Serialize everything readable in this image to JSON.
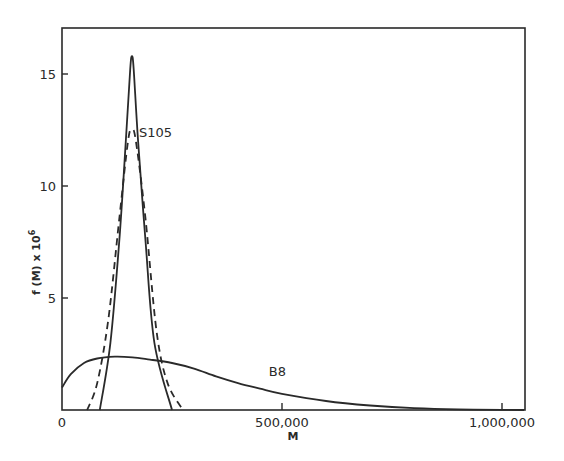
{
  "chart_data": {
    "type": "line",
    "title": "",
    "xlabel": "M",
    "ylabel": "f (M) x 10^6",
    "ylabel_display": "f (M) x 10",
    "ylabel_sup": "6",
    "xlim": [
      0,
      1050000
    ],
    "ylim": [
      0,
      17
    ],
    "grid": false,
    "legend": "none (inline labels)",
    "x_ticks": [
      {
        "value": 0,
        "label": "0"
      },
      {
        "value": 500000,
        "label": "500,000"
      },
      {
        "value": 1000000,
        "label": "1,000,000"
      }
    ],
    "y_ticks": [
      {
        "value": 5,
        "label": "5"
      },
      {
        "value": 10,
        "label": "10"
      },
      {
        "value": 15,
        "label": "15"
      }
    ],
    "series": [
      {
        "name": "S105 (solid)",
        "style": "solid",
        "x": [
          86000,
          110000,
          130000,
          145000,
          155000,
          159000,
          163000,
          173000,
          190000,
          210000,
          250000
        ],
        "y": [
          0,
          3.0,
          7.5,
          12.0,
          15.2,
          15.8,
          15.2,
          12.0,
          7.5,
          3.0,
          0
        ]
      },
      {
        "name": "S105 (dashed)",
        "style": "dashed",
        "x": [
          57000,
          80000,
          105000,
          130000,
          150000,
          159000,
          168000,
          190000,
          215000,
          240000,
          275000
        ],
        "y": [
          0,
          1.2,
          4.0,
          8.5,
          12.0,
          12.5,
          12.0,
          8.5,
          3.5,
          1.2,
          0
        ]
      },
      {
        "name": "B8",
        "style": "solid",
        "x": [
          0,
          20000,
          50000,
          80000,
          120000,
          160000,
          200000,
          250000,
          300000,
          350000,
          400000,
          450000,
          500000,
          600000,
          700000,
          800000,
          900000,
          1000000,
          1050000
        ],
        "y": [
          1.0,
          1.6,
          2.1,
          2.3,
          2.38,
          2.35,
          2.25,
          2.1,
          1.85,
          1.5,
          1.2,
          0.95,
          0.72,
          0.4,
          0.2,
          0.08,
          0.03,
          0.01,
          0.0
        ]
      }
    ],
    "annotations": [
      {
        "text": "S105",
        "x": 175000,
        "y": 12.2
      },
      {
        "text": "B8",
        "x": 470000,
        "y": 1.5
      }
    ]
  }
}
